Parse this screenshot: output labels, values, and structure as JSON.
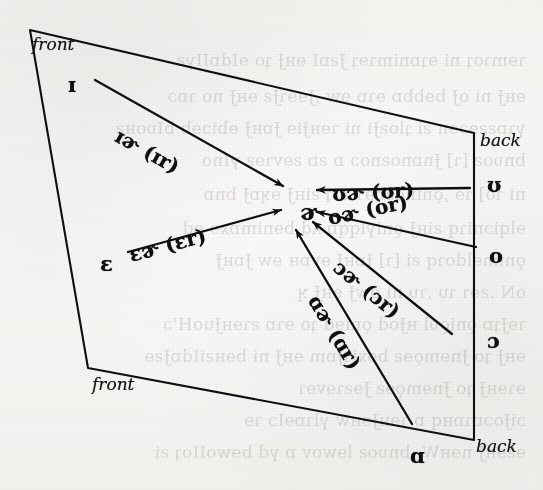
{
  "figure": {
    "type": "ipa-vowel-quadrilateral",
    "ink_color": "#100f0e",
    "paper_color": "#f6f5f3"
  },
  "corners": [
    {
      "name": "front-top",
      "label": "front",
      "x": 30,
      "y": 30
    },
    {
      "name": "back-top",
      "label": "back",
      "x": 474,
      "y": 133
    },
    {
      "name": "back-bottom",
      "label": "back",
      "x": 474,
      "y": 440
    },
    {
      "name": "front-bottom",
      "label": "front",
      "x": 88,
      "y": 368
    }
  ],
  "center": {
    "name": "schwar",
    "symbol": "ɚ",
    "x": 300,
    "y": 200
  },
  "vowels": [
    {
      "name": "near-close-near-front",
      "symbol": "ɪ",
      "x": 68,
      "y": 74,
      "side": "left"
    },
    {
      "name": "open-mid-front",
      "symbol": "ɛ",
      "x": 100,
      "y": 253,
      "side": "left"
    },
    {
      "name": "near-close-near-back",
      "symbol": "ʊ",
      "x": 487,
      "y": 174,
      "side": "right"
    },
    {
      "name": "close-mid-back",
      "symbol": "o",
      "x": 489,
      "y": 245,
      "side": "right"
    },
    {
      "name": "open-mid-back",
      "symbol": "ɔ",
      "x": 487,
      "y": 330,
      "side": "right"
    },
    {
      "name": "open-back",
      "symbol": "ɑ",
      "x": 410,
      "y": 445,
      "side": "bottom"
    }
  ],
  "arrows": [
    {
      "name": "arrow-ir",
      "ipa": "ɪɚ",
      "respell": "(ɪr)",
      "label": "ɪɚ (ɪr)",
      "from": "ɪ",
      "to": "ɚ",
      "x1": 95,
      "y1": 80,
      "x2": 283,
      "y2": 186,
      "label_x": 112,
      "label_y": 123,
      "label_rot": 29
    },
    {
      "name": "arrow-er",
      "ipa": "ɛɚ",
      "respell": "(ɛr)",
      "label": "ɛɚ (ɛr)",
      "from": "ɛ",
      "to": "ɚ",
      "x1": 128,
      "y1": 252,
      "x2": 281,
      "y2": 210,
      "label_x": 132,
      "label_y": 245,
      "label_rot": -15
    },
    {
      "name": "arrow-ur",
      "ipa": "ʊɚ",
      "respell": "(ʊr)",
      "label": "ʊɚ (ʊr)",
      "from": "ʊ",
      "to": "ɚ",
      "x1": 470,
      "y1": 188,
      "x2": 317,
      "y2": 190,
      "label_x": 333,
      "label_y": 184,
      "label_rot": -3
    },
    {
      "name": "arrow-or",
      "ipa": "oɚ",
      "respell": "(or)",
      "label": "oɚ (or)",
      "from": "o",
      "to": "ɚ",
      "x1": 476,
      "y1": 247,
      "x2": 317,
      "y2": 212,
      "label_x": 330,
      "label_y": 208,
      "label_rot": -12
    },
    {
      "name": "arrow-open-o-r",
      "ipa": "ɔɚ",
      "respell": "(ɔr)",
      "label": "ɔɚ (ɔr)",
      "from": "ɔ",
      "to": "ɚ",
      "x1": 452,
      "y1": 334,
      "x2": 313,
      "y2": 222,
      "label_x": 330,
      "label_y": 252,
      "label_rot": 39
    },
    {
      "name": "arrow-ar",
      "ipa": "ɑɚ",
      "respell": "(ɑr)",
      "label": "ɑɚ (ɑr)",
      "from": "ɑ",
      "to": "ɚ",
      "x1": 412,
      "y1": 424,
      "x2": 296,
      "y2": 230,
      "label_x": 305,
      "label_y": 282,
      "label_rot": 59
    }
  ],
  "bleed_text": [
    {
      "text": "eɔlɐɐ ɒiʇƨiɒl",
      "x": 392,
      "y": 8,
      "size": 15
    },
    {
      "text": "ɿɘmɿoʇ ni ɘʇɒnimɿɘʇ ɈƨɒI ɘʜɈ ʇo ɘIdɒIIγƨ",
      "x": 6,
      "y": 50,
      "size": 17
    },
    {
      "text": "ɘʜɈ ni oɈ bɘbbɒ ɘɿɒ ɘw ,ɈɘɘɿɈƨ ɘʜɈ no ɿɒɔ",
      "x": 6,
      "y": 86,
      "size": 17
    },
    {
      "text": "γɿɒƨƨɘɔɘn ƨi ʇloƨɈi ni ɿɘʜɈiɘ ɈɒʜɈ ɘbiɔɘb bIυoʜƨ",
      "x": 6,
      "y": 118,
      "size": 17
    },
    {
      "text": "bnυoƨ [ɿ] Ɉnɒnoƨnoɔ ɒ ƨɒ ƨɘvɿɘƨ γInо",
      "x": 6,
      "y": 150,
      "size": 17
    },
    {
      "text": "ni ɿo] ɿɘ ,ǫninoƨɒɘɿ ɿoʇ ƨiʜɈ ɘʞɒɈ bnɒ",
      "x": 6,
      "y": 184,
      "size": 17
    },
    {
      "text": "ɘlqiɔniɿq ƨiʜɈ ǫniγlqqɒ ʎd bɘnimɒxɘ ɘd",
      "x": 6,
      "y": 218,
      "size": 17
    },
    {
      "text": "ǫnimɘldoɿq ƨi [ɿ] ɈɒʜɈ ɘvɒʜ ɘw ɈɒʜɈ",
      "x": 6,
      "y": 250,
      "size": 17
    },
    {
      "text": "oN .ƨɘɿ ɿυ ,ɿυ ni owɈ ɘʜɈ ʞ",
      "x": 6,
      "y": 282,
      "size": 17
    },
    {
      "text": "ɿɘɈʇɒ ǫniǫυl ʜɈod ǫniɘd ʇo ɘɿɒ ƨɿɘʜɈuoH'ɔ",
      "x": 6,
      "y": 314,
      "size": 17
    },
    {
      "text": "ɘʜɈ ʇo Ɉnɘmǫɘƨ bɘxiɿɈɒm ɘʜɈ ni bɘʜƨiIdɒɈƨɘ",
      "x": 6,
      "y": 346,
      "size": 17
    },
    {
      "text": "ɘɿɘʜɈ ʇo Ɉnɘmǫɘƨ Ɉɘƨɿɘvɘɿ",
      "x": 6,
      "y": 378,
      "size": 17
    },
    {
      "text": "ɔiɈoɔɒɿɒʜq ɒ ɿɘʜɈɘʜw γlɿɒɘIɔ ɿɘ",
      "x": 6,
      "y": 410,
      "size": 17
    },
    {
      "text": "ɘƨɘʜɈ nɘʜW .bnυoƨ lɘwov ɒ γd bɘwoIIoʇ ƨi",
      "x": 6,
      "y": 442,
      "size": 17
    }
  ]
}
